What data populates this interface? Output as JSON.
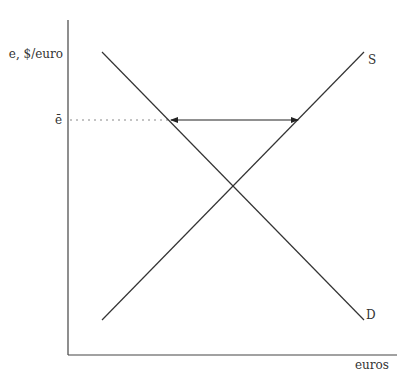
{
  "diagram": {
    "type": "supply-demand",
    "y_axis_label": "e, $/euro",
    "x_axis_label": "euros",
    "price_level_label": "ē",
    "curves": [
      {
        "name": "S",
        "label": "S",
        "kind": "supply",
        "from": [
          102,
          320
        ],
        "to": [
          364,
          52
        ]
      },
      {
        "name": "D",
        "label": "D",
        "kind": "demand",
        "from": [
          102,
          52
        ],
        "to": [
          364,
          320
        ]
      }
    ],
    "gap_arrow": {
      "y": 120,
      "x_left": 171,
      "x_right": 298,
      "direction": "both"
    },
    "colors": {
      "line": "#333333",
      "dotted": "#888888",
      "background": "#ffffff"
    }
  }
}
